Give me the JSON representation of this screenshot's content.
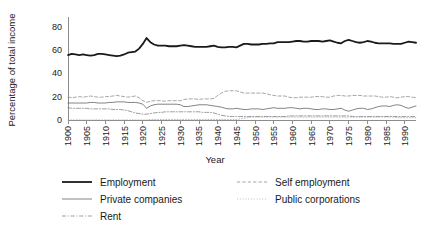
{
  "chart_data": {
    "type": "line",
    "title": "",
    "xlabel": "Year",
    "ylabel": "Percentage of total income",
    "xlim": [
      1900,
      1993
    ],
    "ylim": [
      0,
      88
    ],
    "yticks": [
      0,
      20,
      40,
      60,
      80
    ],
    "xticks": [
      1900,
      1905,
      1910,
      1915,
      1920,
      1925,
      1930,
      1935,
      1940,
      1945,
      1950,
      1955,
      1960,
      1965,
      1970,
      1975,
      1980,
      1985,
      1990
    ],
    "grid": false,
    "legend_position": "below",
    "x": [
      1900,
      1901,
      1902,
      1903,
      1904,
      1905,
      1906,
      1907,
      1908,
      1909,
      1910,
      1911,
      1912,
      1913,
      1914,
      1915,
      1916,
      1917,
      1918,
      1919,
      1920,
      1921,
      1922,
      1923,
      1924,
      1925,
      1926,
      1927,
      1928,
      1929,
      1930,
      1931,
      1932,
      1933,
      1934,
      1935,
      1936,
      1937,
      1938,
      1939,
      1940,
      1941,
      1942,
      1943,
      1944,
      1945,
      1946,
      1947,
      1948,
      1949,
      1950,
      1951,
      1952,
      1953,
      1954,
      1955,
      1956,
      1957,
      1958,
      1959,
      1960,
      1961,
      1962,
      1963,
      1964,
      1965,
      1966,
      1967,
      1968,
      1969,
      1970,
      1971,
      1972,
      1973,
      1974,
      1975,
      1976,
      1977,
      1978,
      1979,
      1980,
      1981,
      1982,
      1983,
      1984,
      1985,
      1986,
      1987,
      1988,
      1989,
      1990,
      1991,
      1992,
      1993
    ],
    "series": [
      {
        "name": "Employment",
        "style": "solid",
        "width": 1.8,
        "color": "#1a1a1a",
        "values": [
          55.5,
          56.5,
          56.0,
          55.5,
          56.0,
          55.5,
          55.0,
          55.5,
          56.5,
          56.5,
          56.0,
          55.5,
          55.0,
          54.5,
          55.0,
          56.0,
          57.5,
          58.0,
          58.5,
          61.0,
          65.0,
          70.0,
          66.5,
          64.5,
          63.5,
          63.5,
          63.5,
          63.0,
          63.0,
          63.0,
          63.5,
          64.0,
          63.5,
          63.0,
          62.5,
          62.5,
          62.5,
          62.5,
          63.0,
          63.5,
          62.5,
          62.0,
          62.0,
          62.5,
          62.5,
          62.0,
          63.5,
          65.0,
          65.0,
          64.5,
          64.5,
          64.5,
          65.0,
          65.0,
          65.5,
          65.5,
          66.5,
          66.5,
          66.5,
          66.5,
          67.0,
          67.5,
          67.5,
          67.0,
          67.0,
          67.5,
          67.5,
          67.5,
          67.0,
          67.5,
          68.0,
          67.0,
          66.0,
          65.5,
          67.5,
          68.5,
          67.5,
          66.5,
          66.0,
          66.5,
          67.5,
          67.0,
          66.0,
          65.5,
          65.5,
          65.5,
          65.5,
          65.0,
          65.0,
          65.0,
          66.0,
          67.0,
          66.5,
          66.0
        ]
      },
      {
        "name": "Private companies",
        "style": "solid",
        "width": 0.7,
        "color": "#4d4d4d",
        "values": [
          14.5,
          14.5,
          14.5,
          14.5,
          14.5,
          14.5,
          15.0,
          15.0,
          14.5,
          14.5,
          14.5,
          15.0,
          15.0,
          15.5,
          15.5,
          15.5,
          15.0,
          15.0,
          15.0,
          14.5,
          13.5,
          10.0,
          12.0,
          13.0,
          13.5,
          13.5,
          13.5,
          13.5,
          13.5,
          13.5,
          13.0,
          11.5,
          11.5,
          12.0,
          12.5,
          13.0,
          13.0,
          13.0,
          12.5,
          12.0,
          11.5,
          11.0,
          10.0,
          9.5,
          9.5,
          10.0,
          9.5,
          9.0,
          9.0,
          9.5,
          9.5,
          9.5,
          9.0,
          9.5,
          10.0,
          10.5,
          10.0,
          10.0,
          10.0,
          10.5,
          10.5,
          10.0,
          9.5,
          10.0,
          10.0,
          9.5,
          9.0,
          9.0,
          9.5,
          9.5,
          9.0,
          9.0,
          9.5,
          10.0,
          8.5,
          7.5,
          8.5,
          9.5,
          10.0,
          10.0,
          9.0,
          9.5,
          10.5,
          11.5,
          12.0,
          12.0,
          11.5,
          12.5,
          13.0,
          12.5,
          11.0,
          10.0,
          11.0,
          12.0
        ]
      },
      {
        "name": "Rent",
        "style": "dashdot",
        "width": 0.7,
        "color": "#737373",
        "values": [
          10.5,
          10.0,
          10.0,
          10.0,
          10.0,
          10.0,
          9.5,
          9.5,
          9.5,
          9.5,
          9.5,
          9.5,
          9.0,
          9.0,
          9.0,
          8.5,
          8.0,
          7.0,
          6.0,
          5.5,
          5.0,
          5.0,
          5.5,
          6.0,
          6.5,
          6.5,
          7.0,
          7.0,
          7.0,
          7.0,
          7.0,
          7.0,
          7.0,
          7.0,
          7.0,
          7.0,
          6.5,
          6.5,
          6.5,
          6.0,
          5.0,
          4.0,
          3.5,
          3.0,
          3.0,
          3.0,
          3.0,
          3.0,
          3.0,
          3.0,
          3.0,
          3.0,
          3.0,
          3.0,
          3.0,
          3.0,
          3.0,
          3.0,
          3.0,
          3.5,
          3.5,
          3.5,
          3.5,
          3.5,
          3.5,
          3.5,
          3.5,
          3.5,
          3.5,
          3.5,
          3.5,
          3.5,
          3.5,
          3.5,
          3.5,
          3.5,
          3.0,
          3.0,
          3.0,
          3.0,
          3.0,
          3.0,
          3.0,
          3.0,
          3.0,
          3.0,
          3.0,
          3.0,
          3.0,
          3.0,
          3.0,
          3.0,
          3.0,
          3.0
        ]
      },
      {
        "name": "Self employment",
        "style": "dashed",
        "width": 0.7,
        "color": "#808080",
        "values": [
          19.5,
          19.0,
          19.5,
          20.0,
          19.5,
          20.0,
          20.5,
          20.0,
          19.5,
          19.5,
          20.0,
          20.0,
          20.5,
          21.0,
          20.5,
          20.0,
          19.5,
          20.0,
          20.5,
          19.0,
          16.5,
          15.0,
          16.0,
          16.5,
          16.5,
          16.5,
          16.0,
          16.5,
          16.5,
          16.5,
          16.5,
          17.5,
          18.0,
          18.0,
          18.0,
          17.5,
          18.0,
          18.0,
          18.0,
          18.5,
          21.0,
          23.0,
          24.5,
          25.0,
          25.0,
          25.0,
          24.0,
          23.0,
          23.0,
          23.0,
          23.0,
          23.0,
          23.0,
          22.5,
          21.5,
          21.0,
          20.5,
          20.5,
          20.5,
          19.5,
          19.0,
          19.0,
          19.5,
          19.5,
          19.5,
          19.5,
          20.0,
          20.0,
          20.0,
          19.5,
          19.5,
          20.5,
          21.0,
          21.0,
          20.5,
          20.5,
          21.0,
          21.0,
          21.0,
          20.5,
          20.5,
          20.5,
          20.5,
          20.0,
          19.5,
          19.5,
          20.0,
          19.5,
          19.0,
          19.5,
          20.0,
          20.0,
          19.5,
          19.0
        ]
      },
      {
        "name": "Public corporations",
        "style": "dotted",
        "width": 0.7,
        "color": "#999999",
        "values": [
          0.0,
          0.0,
          0.0,
          0.0,
          0.0,
          0.0,
          0.0,
          0.0,
          0.0,
          0.0,
          0.0,
          0.0,
          0.0,
          0.0,
          0.0,
          0.0,
          0.0,
          0.0,
          0.0,
          0.0,
          0.0,
          0.0,
          0.5,
          0.5,
          0.5,
          0.5,
          0.5,
          0.5,
          0.5,
          0.5,
          0.5,
          0.5,
          0.5,
          0.5,
          0.5,
          0.5,
          0.5,
          0.5,
          0.5,
          0.5,
          0.5,
          0.5,
          0.5,
          0.5,
          0.5,
          0.5,
          1.0,
          1.5,
          2.0,
          2.5,
          2.5,
          2.5,
          2.5,
          2.5,
          2.5,
          2.5,
          2.5,
          2.5,
          2.5,
          2.5,
          2.5,
          2.5,
          2.5,
          2.5,
          2.5,
          2.5,
          2.5,
          2.5,
          2.5,
          2.5,
          2.5,
          2.5,
          2.5,
          2.5,
          2.5,
          2.5,
          2.5,
          2.5,
          2.5,
          2.5,
          2.5,
          2.5,
          2.5,
          2.5,
          2.5,
          2.5,
          2.5,
          2.5,
          2.0,
          2.0,
          2.0,
          2.0,
          2.0,
          2.0
        ]
      }
    ]
  },
  "legend": {
    "column1": [
      {
        "label": "Employment",
        "style": "solid-thick"
      },
      {
        "label": "Private companies",
        "style": "solid-thin"
      },
      {
        "label": "Rent",
        "style": "dashdot"
      }
    ],
    "column2": [
      {
        "label": "Self employment",
        "style": "dashed"
      },
      {
        "label": "Public corporations",
        "style": "dotted"
      }
    ]
  }
}
